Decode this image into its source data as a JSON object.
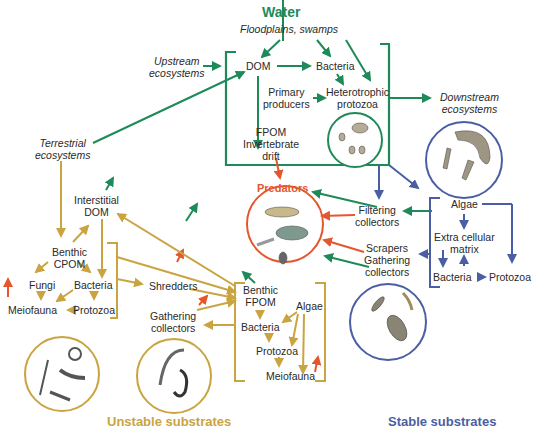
{
  "colors": {
    "water": "#1e8a5a",
    "unstable": "#c9a441",
    "stable": "#4a5fa3",
    "predator": "#e4572e",
    "text": "#2a2a2a"
  },
  "water": {
    "title": "Water",
    "floodplains": "Floodplains, swamps",
    "upstream": [
      "Upstream",
      "ecosystems"
    ],
    "dom": "DOM",
    "bacteria": "Bacteria",
    "primary_producers": [
      "Primary",
      "producers"
    ],
    "heterotrophic_protozoa": [
      "Heterotrophic",
      "protozoa"
    ],
    "fpom_drift": [
      "FPOM",
      "Invertebrate",
      "drift"
    ],
    "downstream": [
      "Downstream",
      "ecosystems"
    ]
  },
  "terrestrial": [
    "Terrestrial",
    "ecosystems"
  ],
  "predators": {
    "title": "Predators"
  },
  "middle": {
    "filtering_collectors": [
      "Filtering",
      "collectors"
    ],
    "scrapers": "Scrapers",
    "gathering_collectors": [
      "Gathering",
      "collectors"
    ]
  },
  "unstable": {
    "title": "Unstable substrates",
    "interstitial_dom": [
      "Interstitial",
      "DOM"
    ],
    "benthic_cpom": [
      "Benthic",
      "CPOM"
    ],
    "fungi": "Fungi",
    "bacteria": "Bacteria",
    "meiofauna": "Meiofauna",
    "protozoa": "Protozoa",
    "shredders": "Shredders",
    "gathering_collectors": [
      "Gathering",
      "collectors"
    ],
    "benthic_fpom": [
      "Benthic",
      "FPOM"
    ],
    "algae": "Algae",
    "fpom_bacteria": "Bacteria",
    "fpom_protozoa": "Protozoa",
    "fpom_meiofauna": "Meiofauna"
  },
  "stable": {
    "title": "Stable substrates",
    "algae": "Algae",
    "extra_cellular_matrix": [
      "Extra cellular",
      "matrix"
    ],
    "bacteria": "Bacteria",
    "protozoa": "Protozoa"
  }
}
